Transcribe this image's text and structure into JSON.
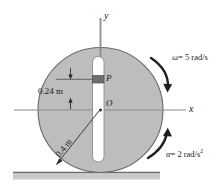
{
  "figure": {
    "type": "mechanics-free-body-diagram",
    "axes": {
      "y_label": "y",
      "x_label": "x"
    },
    "points": {
      "center_label": "O",
      "slider_label": "P"
    },
    "dimensions": {
      "offset_label": "0.24 m",
      "radius_label": "0.4 m"
    },
    "kinematics": {
      "angular_velocity": "ω = 5 rad/s",
      "angular_velocity_symbol": "ω",
      "angular_velocity_value": "= 5 rad/s",
      "angular_acceleration_symbol": "α",
      "angular_acceleration_value": "= 2 rad/s",
      "angular_acceleration_exponent": "2"
    },
    "colors": {
      "disk_fill": "#bdbdbd",
      "disk_stroke": "#5a5a5a",
      "slot_fill": "#ffffff",
      "block_fill": "#6e6e6e",
      "ground_fill": "#c9c9c9",
      "line": "#4d4d4d",
      "text": "#1a1a1a"
    },
    "icons": {
      "omega_arc": "clockwise-arc-arrow",
      "alpha_arc": "counter-arc-arrow",
      "y_axis": "axis-arrow-vertical",
      "x_axis": "axis-arrow-horizontal",
      "dim_arrow_top": "dimension-arrow-down",
      "dim_arrow_bottom": "dimension-arrow-up",
      "radius_arrow": "radius-leader-arrow",
      "ground": "ground-surface"
    }
  }
}
